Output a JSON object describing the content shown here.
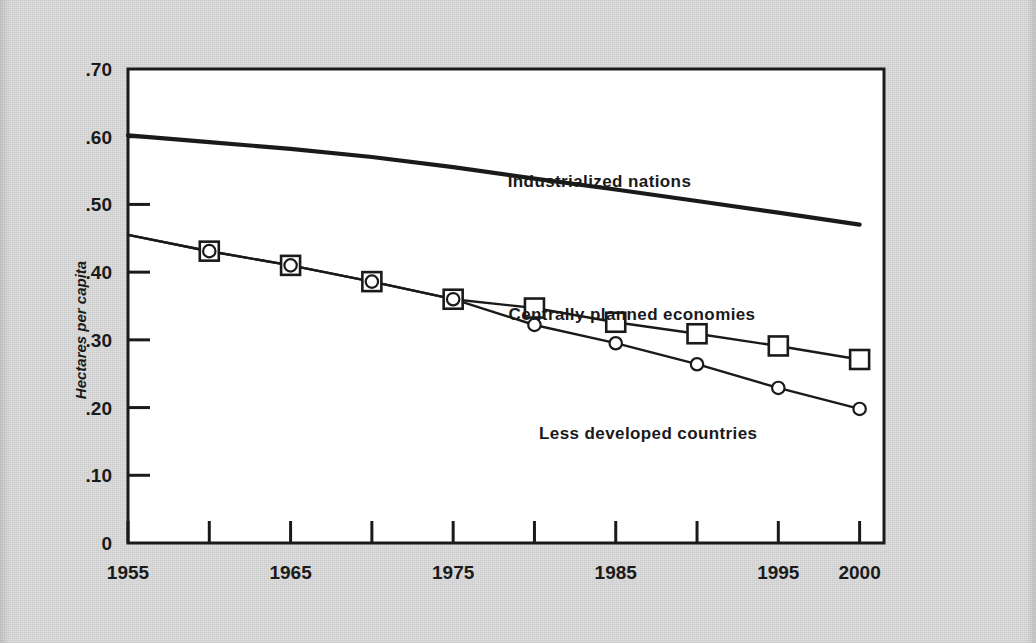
{
  "figure": {
    "background_color": "#dcdcdc",
    "plot_background_color": "#ffffff",
    "ink_color": "#1a1a1a"
  },
  "chart_data": {
    "type": "line",
    "title": "",
    "subtitle": "",
    "xlabel": "",
    "ylabel": "Hectares per capita",
    "xlim": [
      1955,
      2001.5
    ],
    "ylim": [
      0,
      0.7
    ],
    "grid": false,
    "legend_position": "inline-annotations",
    "y_ticks": [
      0,
      0.1,
      0.2,
      0.3,
      0.4,
      0.5,
      0.6,
      0.7
    ],
    "y_tick_labels": [
      "0",
      ".10",
      ".20",
      ".30",
      ".40",
      ".50",
      ".60",
      ".70"
    ],
    "x_ticks": [
      1955,
      1960,
      1965,
      1970,
      1975,
      1980,
      1985,
      1990,
      1995,
      2000
    ],
    "x_tick_labels": [
      "1955",
      "",
      "1965",
      "",
      "1975",
      "",
      "1985",
      "",
      "1995",
      "2000"
    ],
    "x_labeled_ticks": [
      {
        "year": 1955,
        "label": "1955"
      },
      {
        "year": 1965,
        "label": "1965"
      },
      {
        "year": 1975,
        "label": "1975"
      },
      {
        "year": 1985,
        "label": "1985"
      },
      {
        "year": 1995,
        "label": "1995"
      },
      {
        "year": 2000,
        "label": "2000"
      }
    ],
    "series": [
      {
        "name": "Industrialized nations",
        "marker": "none",
        "label_position": {
          "year": 1984,
          "value": 0.535
        },
        "x": [
          1955,
          1960,
          1965,
          1970,
          1975,
          1980,
          1985,
          1990,
          1995,
          2000
        ],
        "values": [
          0.602,
          0.592,
          0.582,
          0.57,
          0.555,
          0.538,
          0.522,
          0.505,
          0.488,
          0.47
        ]
      },
      {
        "name": "Centrally planned economies",
        "marker": "square",
        "label_position": {
          "year": 1986,
          "value": 0.338
        },
        "x": [
          1955,
          1960,
          1965,
          1970,
          1975,
          1980,
          1985,
          1990,
          1995,
          2000
        ],
        "values": [
          0.455,
          0.431,
          0.41,
          0.386,
          0.36,
          0.347,
          0.326,
          0.309,
          0.291,
          0.271
        ]
      },
      {
        "name": "Less developed countries",
        "marker": "circle",
        "label_position": {
          "year": 1987,
          "value": 0.163
        },
        "x": [
          1955,
          1960,
          1965,
          1970,
          1975,
          1980,
          1985,
          1990,
          1995,
          2000
        ],
        "values": [
          0.455,
          0.431,
          0.41,
          0.386,
          0.36,
          0.322,
          0.295,
          0.264,
          0.229,
          0.198
        ]
      }
    ]
  }
}
